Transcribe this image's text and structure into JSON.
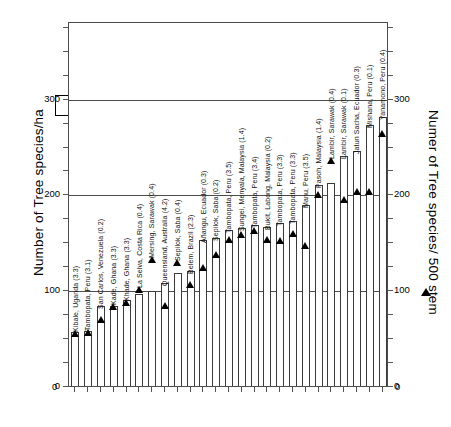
{
  "chart_data": {
    "type": "bar",
    "title": "",
    "subtitle": "",
    "left_axis": {
      "label": "Number of Tree species/ha",
      "legend_symbol": "white-square",
      "ticks": [
        0,
        100,
        200,
        300
      ],
      "ylim": [
        0,
        380
      ],
      "gridlines": [
        100,
        200,
        300
      ]
    },
    "right_axis": {
      "label": "Numer of Tree species/ 500 stem",
      "legend_symbol": "black-triangle",
      "ticks": [
        0,
        100,
        200,
        300
      ],
      "ylim": [
        0,
        380
      ]
    },
    "xlabel": "",
    "grid": true,
    "legend_position": "outside-axis-titles",
    "categories": [
      "Kibale, Uganda (3.3)",
      "Tambopata, Peru (3.1)",
      "San Carlos, Venezuela (0.2)",
      "Kade, Ghana (3.3)",
      "Khade, Ghana (3.3)",
      "La Selva, Costa Rica (0.4)",
      "Mersing, Sarawak (0.4)",
      "Queensland, Australia (4.2)",
      "Sepilok, Saba (0.4)",
      "Belem, Brazil (2.3)",
      "Añangu, Ecuador (0.3)",
      "Sepilok, Saba (0.2)",
      "Tambopata, Peru (3.5)",
      "Sungei, Menyala, Malaysia (1.4)",
      "Tambopata, Peru (3.4)",
      "Bukit, Labong, Malaysia (0.2)",
      "Tambopata, Peru (3.3)",
      "Tambopata, Peru (3.3)",
      "Manu, Peru (3.5)",
      "Pasoh, Malaysia (1.4)",
      "Lambir, Sarawak (0.4)",
      "Lambir, Sarawak (0.1)",
      "Jatun Sacha, Ecuador (0.3)",
      "Mishana, Peru (0.1)",
      "Yanamono, Peru (0.4)"
    ],
    "series": [
      {
        "name": "Number of Tree species/ha",
        "symbol": "white-square",
        "axis": "left",
        "values": [
          56,
          57,
          84,
          84,
          90,
          96,
          99,
          108,
          118,
          120,
          152,
          155,
          163,
          165,
          168,
          166,
          170,
          172,
          189,
          210,
          212,
          240,
          245,
          272,
          281
        ]
      },
      {
        "name": "Numer of Tree species/ 500 stem",
        "symbol": "black-triangle",
        "axis": "right",
        "values": [
          55,
          56,
          70,
          84,
          88,
          101,
          133,
          85,
          129,
          106,
          124,
          138,
          153,
          159,
          163,
          153,
          152,
          160,
          147,
          200,
          236,
          195,
          204,
          204,
          264
        ]
      }
    ]
  },
  "axes": {
    "left_title": "Number of Tree species/ha",
    "right_title": "Numer of Tree species/ 500 stem",
    "tick_labels": [
      "0",
      "100",
      "200",
      "300"
    ]
  }
}
